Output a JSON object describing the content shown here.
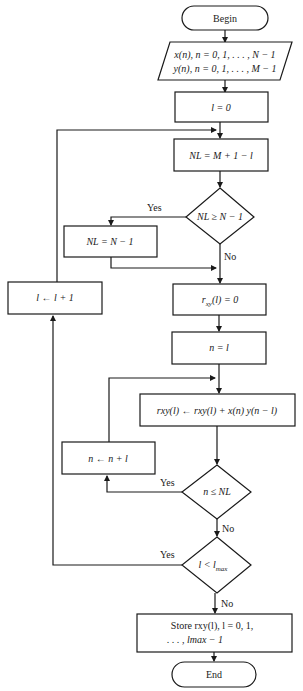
{
  "diagram": {
    "type": "flowchart",
    "nodes": {
      "begin": {
        "shape": "terminator",
        "label": "Begin"
      },
      "input": {
        "shape": "parallelogram",
        "line1": "x(n), n = 0, 1, . . . , N − 1",
        "line2": "y(n), n = 0, 1, . . . , M − 1"
      },
      "init_l": {
        "shape": "process",
        "label": "l = 0"
      },
      "calc_nl": {
        "shape": "process",
        "label": "NL = M + 1 − l"
      },
      "dec_nl": {
        "shape": "decision",
        "label": "NL ≥ N − 1"
      },
      "set_nl": {
        "shape": "process",
        "label": "NL = N − 1"
      },
      "init_r": {
        "shape": "process",
        "label_main": "r",
        "label_sub": "xy",
        "label_tail": "(l) = 0"
      },
      "init_n": {
        "shape": "process",
        "label": "n = l"
      },
      "accum": {
        "shape": "process",
        "label": "rxy(l) ← rxy(l) + x(n) y(n − l)"
      },
      "inc_n": {
        "shape": "process",
        "label": "n ← n + l"
      },
      "dec_n": {
        "shape": "decision",
        "label": "n ≤ NL"
      },
      "dec_l": {
        "shape": "decision",
        "label_main": "l < l",
        "label_sub": "max"
      },
      "inc_l": {
        "shape": "process",
        "label": "l ← l + 1"
      },
      "store": {
        "shape": "process",
        "line1": "Store rxy(l), l = 0, 1,",
        "line2": ". . . , lmax − 1"
      },
      "end": {
        "shape": "terminator",
        "label": "End"
      }
    },
    "edge_labels": {
      "dec_nl_yes": "Yes",
      "dec_nl_no": "No",
      "dec_n_yes": "Yes",
      "dec_n_no": "No",
      "dec_l_yes": "Yes",
      "dec_l_no": "No"
    },
    "edges": [
      {
        "from": "begin",
        "to": "input"
      },
      {
        "from": "input",
        "to": "init_l"
      },
      {
        "from": "init_l",
        "to": "calc_nl"
      },
      {
        "from": "calc_nl",
        "to": "dec_nl"
      },
      {
        "from": "dec_nl",
        "to": "set_nl",
        "label": "Yes"
      },
      {
        "from": "dec_nl",
        "to": "init_r",
        "label": "No"
      },
      {
        "from": "set_nl",
        "to": "init_r"
      },
      {
        "from": "init_r",
        "to": "init_n"
      },
      {
        "from": "init_n",
        "to": "accum"
      },
      {
        "from": "accum",
        "to": "dec_n"
      },
      {
        "from": "dec_n",
        "to": "inc_n",
        "label": "Yes"
      },
      {
        "from": "inc_n",
        "to": "accum"
      },
      {
        "from": "dec_n",
        "to": "dec_l",
        "label": "No"
      },
      {
        "from": "dec_l",
        "to": "inc_l",
        "label": "Yes"
      },
      {
        "from": "inc_l",
        "to": "calc_nl"
      },
      {
        "from": "dec_l",
        "to": "store",
        "label": "No"
      },
      {
        "from": "store",
        "to": "end"
      }
    ]
  }
}
